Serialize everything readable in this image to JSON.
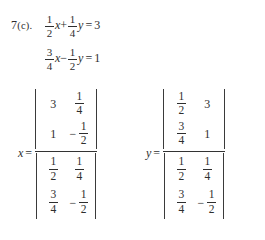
{
  "document": {
    "background_color": "#ffffff",
    "text_color": "#2e2e2e",
    "problem_label": "7",
    "problem_part": "(c).",
    "topic": "Cramer's Rule - system of two linear equations"
  },
  "system": {
    "equation_1": {
      "term_1": {
        "coefficient_numerator": "1",
        "coefficient_denominator": "2",
        "variable": "x"
      },
      "operator_1": "+",
      "term_2": {
        "coefficient_numerator": "1",
        "coefficient_denominator": "4",
        "variable": "y"
      },
      "equals": "=",
      "constant": "3"
    },
    "equation_2": {
      "term_1": {
        "coefficient_numerator": "3",
        "coefficient_denominator": "4",
        "variable": "x"
      },
      "operator_1": "−",
      "term_2": {
        "coefficient_numerator": "1",
        "coefficient_denominator": "2",
        "variable": "y"
      },
      "equals": "=",
      "constant": "1"
    }
  },
  "solution_x": {
    "variable": "x",
    "equals": "=",
    "numerator_determinant": {
      "r1c1": {
        "whole": "3"
      },
      "r1c2": {
        "numerator": "1",
        "denominator": "4"
      },
      "r2c1": {
        "whole": "1"
      },
      "r2c2": {
        "sign": "−",
        "numerator": "1",
        "denominator": "2"
      }
    },
    "denominator_determinant": {
      "r1c1": {
        "numerator": "1",
        "denominator": "2"
      },
      "r1c2": {
        "numerator": "1",
        "denominator": "4"
      },
      "r2c1": {
        "numerator": "3",
        "denominator": "4"
      },
      "r2c2": {
        "sign": "−",
        "numerator": "1",
        "denominator": "2"
      }
    }
  },
  "solution_y": {
    "variable": "y",
    "equals": "=",
    "numerator_determinant": {
      "r1c1": {
        "numerator": "1",
        "denominator": "2"
      },
      "r1c2": {
        "whole": "3"
      },
      "r2c1": {
        "numerator": "3",
        "denominator": "4"
      },
      "r2c2": {
        "whole": "1"
      }
    },
    "denominator_determinant": {
      "r1c1": {
        "numerator": "1",
        "denominator": "2"
      },
      "r1c2": {
        "numerator": "1",
        "denominator": "4"
      },
      "r2c1": {
        "numerator": "3",
        "denominator": "4"
      },
      "r2c2": {
        "sign": "−",
        "numerator": "1",
        "denominator": "2"
      }
    }
  }
}
